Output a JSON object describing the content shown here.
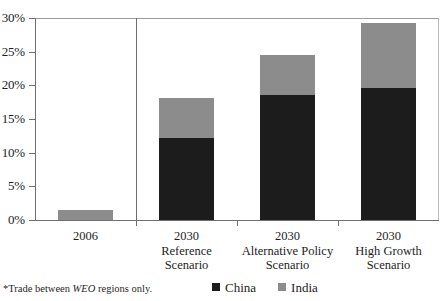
{
  "chart_data": {
    "type": "bar",
    "subtype": "stacked-bar",
    "title": "",
    "xlabel": "",
    "ylabel": "",
    "ylim": [
      0,
      30
    ],
    "yunit": "%",
    "ytick_labels": [
      "0%",
      "5%",
      "10%",
      "15%",
      "20%",
      "25%",
      "30%"
    ],
    "ytick_values": [
      0,
      5,
      10,
      15,
      20,
      25,
      30
    ],
    "grid": false,
    "legend_position": "bottom-center",
    "categories": [
      "2006",
      "2030 Reference Scenario",
      "2030 Alternative Policy Scenario",
      "2030 High Growth Scenario"
    ],
    "category_lines": [
      [
        "2006",
        "",
        ""
      ],
      [
        "2030",
        "Reference",
        "Scenario"
      ],
      [
        "2030",
        "Alternative Policy",
        "Scenario"
      ],
      [
        "2030",
        "High Growth",
        "Scenario"
      ]
    ],
    "series": [
      {
        "name": "China",
        "color": "#1c1c1c",
        "values": [
          0.0,
          12.2,
          18.5,
          19.6
        ]
      },
      {
        "name": "India",
        "color": "#8c8c8c",
        "values": [
          1.5,
          5.9,
          6.0,
          9.7
        ]
      }
    ],
    "totals": [
      1.5,
      18.1,
      24.5,
      29.3
    ],
    "annotations": {
      "divider_after_category_index": 0
    }
  },
  "legend": {
    "items": [
      {
        "label": "China",
        "color": "#1c1c1c"
      },
      {
        "label": "India",
        "color": "#8c8c8c"
      }
    ]
  },
  "footnote": {
    "prefix": "*Trade between ",
    "italic": "WEO",
    "suffix": " regions only."
  }
}
